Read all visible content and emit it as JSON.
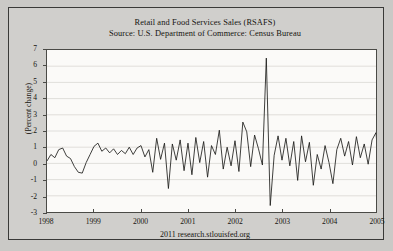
{
  "chart_data": {
    "type": "line",
    "title": "Retail and Food Services Sales (RSAFS)",
    "subtitle": "Source: U.S. Department of Commerce: Census Bureau",
    "xlabel": "",
    "ylabel": "(Percent change)",
    "ylim": [
      -3,
      7
    ],
    "xlim": [
      1998,
      2005
    ],
    "yticks": [
      7,
      6,
      5,
      4,
      3,
      2,
      1,
      0,
      -1,
      -2,
      -3
    ],
    "xticks": [
      "1998",
      "1999",
      "2000",
      "2001",
      "2002",
      "2003",
      "2004",
      "2005"
    ],
    "grid": true,
    "legend": "none",
    "line_color": "#1b1b19",
    "footer": "2011 research.stlouisfed.org",
    "series": [
      {
        "name": "RSAFS percent change",
        "x_start": 1998.0,
        "x_step": 0.08333,
        "values": [
          0.15,
          0.55,
          0.35,
          0.85,
          0.95,
          0.45,
          0.3,
          -0.2,
          -0.55,
          -0.6,
          0.05,
          0.55,
          1.05,
          1.25,
          0.75,
          0.95,
          0.65,
          0.9,
          0.55,
          0.8,
          0.6,
          1.0,
          0.55,
          0.95,
          1.1,
          0.4,
          0.85,
          -0.55,
          1.55,
          0.25,
          1.25,
          -1.55,
          1.2,
          0.2,
          1.45,
          -0.45,
          1.25,
          -0.7,
          1.6,
          0.05,
          1.35,
          -0.85,
          1.1,
          0.55,
          2.05,
          -0.35,
          1.0,
          -0.15,
          1.4,
          -0.5,
          2.55,
          1.95,
          -0.2,
          1.75,
          0.9,
          -0.1,
          6.5,
          -2.6,
          0.5,
          1.7,
          0.2,
          1.55,
          -0.15,
          1.35,
          -1.05,
          1.7,
          0.1,
          1.3,
          -1.35,
          0.55,
          -0.35,
          1.1,
          0.05,
          -1.25,
          0.85,
          1.55,
          0.45,
          1.35,
          -0.1,
          1.65,
          0.35,
          1.2,
          -0.05,
          1.45,
          1.9,
          -1.15,
          1.6,
          -1.2,
          1.95,
          -1.25,
          1.45,
          0.55,
          1.9,
          0.95,
          1.15,
          1.05
        ]
      }
    ]
  }
}
